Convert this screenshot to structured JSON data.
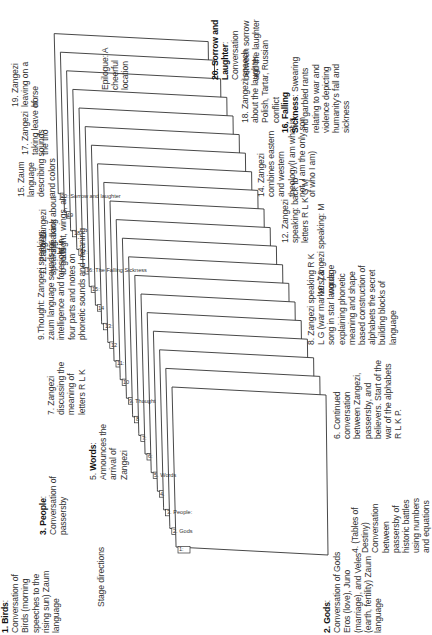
{
  "diagram": {
    "type": "stacked-pages-scene-structure",
    "orientation": "rotated-90-ccw",
    "page_tabs": [
      "1:",
      "2. Gods",
      "3. People:",
      "4.",
      "5. Words",
      "6:",
      "7:",
      "8",
      "9. Thought",
      "10",
      "11:",
      "12",
      "13:",
      "14",
      "15:",
      "16: The Falling Sickness",
      "17:",
      "18",
      "19",
      "20: Sorrow and laughter"
    ],
    "annotations": {
      "birds": {
        "title": "1. Birds",
        "text": ": Conversation of Birds (morning speeches to the rising sun) Zaum language"
      },
      "gods": {
        "title": "2. Gods",
        "text": ": Conversation of Gods Eros (love), Juno (marriage), and Veles (earth, fertility) Zaum language"
      },
      "people": {
        "title": "3. People",
        "text": ": Conversation of passersby"
      },
      "tables": {
        "text": "4. (Tables of Destiny) Conversation between passersby of historic battles using numbers and equations"
      },
      "words": {
        "prefix": "5. ",
        "title": "Words",
        "text": ": Announces the arrival of Zangezi"
      },
      "continued": {
        "text": "6. Continued conversation between Zangezi, passersby, and believers. Start of the war of the alphabets R L K P."
      },
      "z7": {
        "text": "7. Zangezi discussing the meaning of letters R L K"
      },
      "z8": {
        "text": "8. Zangezi speaking R K L G (war markers) & song in star language explaining phonetic meaning and shape based construction of alphabets the secret building blocks of language"
      },
      "thought": {
        "text": "9.Thought: Zangezi speaking: zaum language sounds for intelligence and foresight in four parts and notes on phonetic sounds and meaning"
      },
      "z10": {
        "text": "10. Zangezi speaking: M words"
      },
      "z11": {
        "text": "11. Zangezi speaking: back to gods"
      },
      "z12": {
        "text": "12. Zangezi speaking: back to letters R L K G M"
      },
      "z13": {
        "text": "13. Zangezi speaking about flight, wings, air"
      },
      "z14": {
        "text": "14. Zangezi combines eastern and western theology(I am what is not. I am the only son of who I am)"
      },
      "z15": {
        "text": "15. Zaum language describing sounds and colors"
      },
      "falling": {
        "title": "16. Falling Sickness",
        "text": ": Swearing and garbled rants relating to war and violence depicting humanity's fall and sickness"
      },
      "z17": {
        "text": "17. Zangezi taking leave of the trio"
      },
      "z18": {
        "text": "18. Zangezi speech about the laughter Polish, Tartar, Russian conflict"
      },
      "z19": {
        "text": "19. Zangezi leaving on a horse"
      },
      "sorrow": {
        "title": "20. Sorrow and Laughter",
        "text": ": Conversation between sorrow and the laughter"
      },
      "epilogue": {
        "text": "Epilogue: A cheerful location"
      },
      "stage": {
        "text": "Stage directions"
      }
    }
  }
}
